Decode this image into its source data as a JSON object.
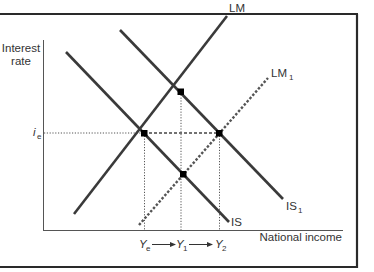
{
  "axes": {
    "y_label_line1": "Interest",
    "y_label_line2": "rate",
    "x_label": "National income"
  },
  "curves": {
    "IS": {
      "label": "IS",
      "style": "solid"
    },
    "IS1": {
      "label": "IS",
      "sub": "1",
      "style": "solid"
    },
    "LM": {
      "label": "LM",
      "style": "solid"
    },
    "LM1": {
      "label": "LM",
      "sub": "1",
      "style": "dashed"
    }
  },
  "y_marks": {
    "ie": {
      "label": "i",
      "sub": "e"
    }
  },
  "x_marks": {
    "Ye": {
      "label": "Y",
      "sub": "e"
    },
    "Y1": {
      "label": "Y",
      "sub": "1"
    },
    "Y2": {
      "label": "Y",
      "sub": "2"
    }
  },
  "points": [
    {
      "id": "E",
      "desc": "IS ∩ LM at (Ye, ie)"
    },
    {
      "id": "A",
      "desc": "IS1 ∩ LM at Y1 (higher interest rate)"
    },
    {
      "id": "B",
      "desc": "IS1 ∩ LM1 at (Y2, ie)"
    },
    {
      "id": "C",
      "desc": "IS ∩ LM1 at Y1 (lower interest rate)"
    }
  ],
  "colors": {
    "line": "#3a3a3a",
    "frame": "#2a2a2a",
    "dot": "#000000"
  }
}
